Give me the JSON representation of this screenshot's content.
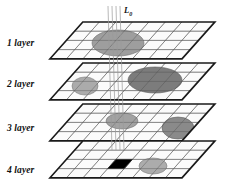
{
  "figure": {
    "background_color": "#ffffff",
    "width": 240,
    "height": 185
  },
  "beam": {
    "label_text": "L",
    "label_subscript": "0",
    "line_count": 4,
    "line_color": "#9a9a9a",
    "description": "vertical probe lines descending through the layers"
  },
  "layers": [
    {
      "id": "layer-1",
      "label": "1 layer",
      "label_x": 7,
      "label_y": 38,
      "origin_x": 50,
      "origin_y": 22,
      "columns": 8,
      "rows": 4,
      "grid_color": "#888888",
      "outline_color": "#1a1a1a",
      "fill_color": "#fbfbfb",
      "shapes": [
        {
          "name": "inclusion-l1-center",
          "type": "ellipse",
          "cx": 118,
          "cy": 43,
          "rx": 26,
          "ry": 13,
          "fill": "#9e9e9e",
          "stroke": "#6e6e6e"
        }
      ]
    },
    {
      "id": "layer-2",
      "label": "2 layer",
      "label_x": 7,
      "label_y": 79,
      "origin_x": 50,
      "origin_y": 63,
      "columns": 8,
      "rows": 4,
      "grid_color": "#888888",
      "outline_color": "#1a1a1a",
      "fill_color": "#fbfbfb",
      "shapes": [
        {
          "name": "inclusion-l2-left",
          "type": "ellipse",
          "cx": 85,
          "cy": 86,
          "rx": 13,
          "ry": 9,
          "fill": "#ababab",
          "stroke": "#7a7a7a"
        },
        {
          "name": "inclusion-l2-center",
          "type": "ellipse",
          "cx": 155,
          "cy": 80,
          "rx": 27,
          "ry": 13,
          "fill": "#7c7c7c",
          "stroke": "#5a5a5a"
        }
      ]
    },
    {
      "id": "layer-3",
      "label": "3 layer",
      "label_x": 7,
      "label_y": 123,
      "origin_x": 50,
      "origin_y": 104,
      "columns": 8,
      "rows": 4,
      "grid_color": "#888888",
      "outline_color": "#1a1a1a",
      "fill_color": "#fbfbfb",
      "shapes": [
        {
          "name": "inclusion-l3-center",
          "type": "ellipse",
          "cx": 122,
          "cy": 121,
          "rx": 16,
          "ry": 8,
          "fill": "#a2a2a2",
          "stroke": "#757575"
        },
        {
          "name": "inclusion-l3-right",
          "type": "ellipse",
          "cx": 178,
          "cy": 128,
          "rx": 16,
          "ry": 11,
          "fill": "#8a8a8a",
          "stroke": "#606060"
        }
      ]
    },
    {
      "id": "layer-4",
      "label": "4 layer",
      "label_x": 7,
      "label_y": 165,
      "origin_x": 50,
      "origin_y": 141,
      "columns": 8,
      "rows": 4,
      "grid_color": "#888888",
      "outline_color": "#1a1a1a",
      "fill_color": "#fbfbfb",
      "shapes": [
        {
          "name": "defect-cell-l4",
          "type": "cell",
          "col": 3,
          "row": 1,
          "fill": "#000000",
          "stroke": "#000000"
        },
        {
          "name": "inclusion-l4-right",
          "type": "ellipse",
          "cx": 153,
          "cy": 166,
          "rx": 14,
          "ry": 8,
          "fill": "#acacac",
          "stroke": "#7d7d7d"
        }
      ]
    }
  ],
  "geometry": {
    "cell_width": 16.5,
    "cell_height": 9.2,
    "skew_x": 8.2,
    "note": "each layer is an isometric parallelogram grid"
  }
}
